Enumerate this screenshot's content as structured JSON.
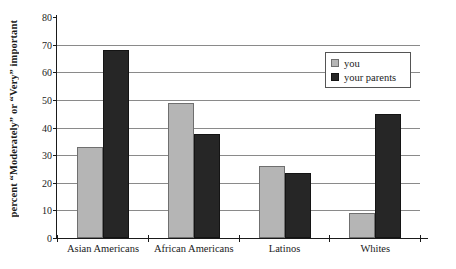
{
  "chart_data": {
    "type": "bar",
    "title": "",
    "subtitle": "",
    "xlabel": "",
    "ylabel": "percent “Moderately” or “Very” important",
    "categories": [
      "Asian Americans",
      "African Americans",
      "Latinos",
      "Whites"
    ],
    "series": [
      {
        "name": "you",
        "color": "#b5b5b5",
        "values": [
          33,
          49,
          26,
          9
        ]
      },
      {
        "name": "your parents",
        "color": "#262626",
        "values": [
          68,
          37.5,
          23.5,
          45
        ]
      }
    ],
    "ylim": [
      0,
      80
    ],
    "ytick_step": 10,
    "yticks": [
      0,
      10,
      20,
      30,
      40,
      50,
      60,
      70,
      80
    ],
    "ytick_labels": [
      "0",
      "10",
      "20",
      "30",
      "40",
      "50",
      "60",
      "70",
      "80"
    ],
    "grid": true,
    "grid_axis": "y",
    "legend_position": "top-right",
    "legend_entries": [
      "you",
      "your parents"
    ],
    "annotations": []
  },
  "legend": {
    "items": [
      {
        "label": "you",
        "swatch": "light-gray-swatch"
      },
      {
        "label": "your parents",
        "swatch": "dark-swatch"
      }
    ]
  },
  "colors": {
    "you_bar": "#b5b5b5",
    "parents_bar": "#262626",
    "gridline": "#8a8a8a",
    "axis": "#1a1a1a",
    "background": "#ffffff"
  }
}
